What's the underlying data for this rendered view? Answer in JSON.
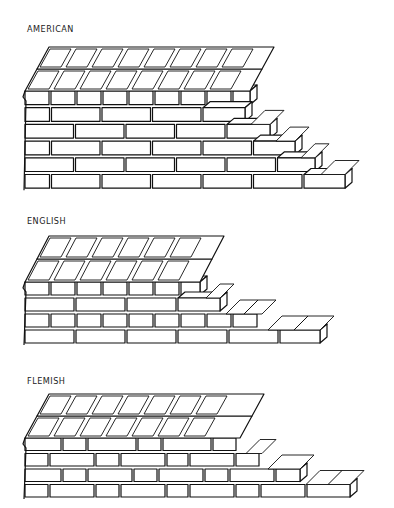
{
  "colors": {
    "line": "#111111",
    "background": "#ffffff"
  },
  "bonds": [
    {
      "id": "american",
      "label": "AMERICAN",
      "label_pos": [
        27,
        30
      ],
      "svg_top": 40,
      "face": {
        "left": 25,
        "top": 50,
        "course_h": 16.7,
        "courses": 6,
        "rows": [
          {
            "type": "header",
            "w": 24,
            "offset": 0,
            "count": 9
          },
          {
            "type": "stretcher",
            "w": 48.5,
            "offset": -24,
            "count": 6
          },
          {
            "type": "stretcher",
            "w": 48.5,
            "offset": 0,
            "count": 6
          },
          {
            "type": "stretcher",
            "w": 48.5,
            "offset": -24,
            "count": 7
          },
          {
            "type": "stretcher",
            "w": 48.5,
            "offset": 0,
            "count": 7
          },
          {
            "type": "stretcher",
            "w": 48.5,
            "offset": -24,
            "count": 8
          }
        ],
        "row_right": [
          250,
          245,
          270,
          295,
          315,
          345
        ]
      },
      "top": {
        "rows": 2,
        "depth": 22,
        "skew": 12,
        "header_w": 24,
        "count": 9
      }
    },
    {
      "id": "english",
      "label": "ENGLISH",
      "label_pos": [
        27,
        222
      ],
      "svg_top": 232,
      "face": {
        "left": 25,
        "top": 49,
        "course_h": 16,
        "courses": 4,
        "rows": [
          {
            "type": "header",
            "w": 24,
            "offset": 0,
            "count": 7
          },
          {
            "type": "stretcher",
            "w": 49,
            "offset": 0,
            "count": 4
          },
          {
            "type": "header",
            "w": 24,
            "offset": 0,
            "count": 9
          },
          {
            "type": "stretcher",
            "w": 49,
            "offset": 0,
            "count": 6
          }
        ],
        "row_right": [
          200,
          220,
          262,
          320
        ]
      },
      "top": {
        "rows": 2,
        "depth": 23,
        "skew": 12,
        "header_w": 24,
        "count": 7
      }
    },
    {
      "id": "flemish",
      "label": "FLEMISH",
      "label_pos": [
        27,
        382
      ],
      "svg_top": 392,
      "face": {
        "left": 25,
        "top": 45,
        "course_h": 15.5,
        "courses": 4,
        "rows": [
          {
            "type": "flemish",
            "pattern": [
              36,
              23,
              48,
              23,
              48,
              23,
              30
            ],
            "offset": 0
          },
          {
            "type": "flemish",
            "pattern": [
              23,
              44,
              23,
              44,
              21,
              44,
              23,
              40
            ],
            "offset": 0
          },
          {
            "type": "flemish",
            "pattern": [
              36,
              23,
              44,
              23,
              44,
              23,
              44,
              40
            ],
            "offset": 0
          },
          {
            "type": "flemish",
            "pattern": [
              23,
              44,
              23,
              44,
              21,
              44,
              23,
              44,
              48,
              30
            ],
            "offset": 0
          }
        ],
        "row_right": [
          240,
          262,
          300,
          350
        ]
      },
      "top": {
        "rows": 2,
        "depth": 22,
        "skew": 12,
        "header_w": 24,
        "count": 7
      }
    }
  ]
}
